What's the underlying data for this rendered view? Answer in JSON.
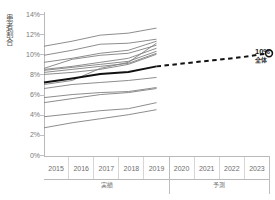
{
  "title": {
    "text": "",
    "clipped": true
  },
  "axes": {
    "y_label": "患者割合",
    "y_ticks": [
      "14%",
      "12%",
      "10%",
      "8%",
      "6%",
      "4%",
      "2%",
      "0%"
    ],
    "x_ticks": [
      "2015",
      "2016",
      "2017",
      "2018",
      "2019",
      "2020",
      "2021",
      "2022",
      "2023"
    ],
    "group_labels": [
      {
        "label": "実績",
        "span": [
          "2015",
          "2019"
        ]
      },
      {
        "label": "予測",
        "span": [
          "2020",
          "2023"
        ]
      }
    ]
  },
  "annotation": {
    "value": "10%",
    "sublabel": "全体"
  },
  "colors": {
    "background": "#ffffff",
    "axis": "#b9b9b9",
    "tick_text": "#7a7a7a",
    "series_light": "#808080",
    "series_total": "#111111",
    "marker_fill": "#ffffff",
    "marker_stroke": "#111111"
  },
  "chart_data": {
    "type": "line",
    "title": "",
    "xlabel": "",
    "ylabel": "患者割合",
    "x": [
      2015,
      2016,
      2017,
      2018,
      2019,
      2020,
      2021,
      2022,
      2023
    ],
    "ylim": [
      0,
      14
    ],
    "yticks": [
      0,
      2,
      4,
      6,
      8,
      10,
      12,
      14
    ],
    "grid": false,
    "legend": "none",
    "actual_range": [
      2015,
      2019
    ],
    "forecast_range": [
      2019,
      2023
    ],
    "series": [
      {
        "name": "全体",
        "emphasis": "total",
        "style": "solid-bold",
        "values": [
          7.2,
          7.6,
          8.05,
          8.25,
          8.8,
          null,
          null,
          null,
          null
        ]
      },
      {
        "name": "全体 (予測)",
        "emphasis": "total",
        "style": "dashed",
        "values": [
          null,
          null,
          null,
          null,
          8.8,
          9.1,
          9.4,
          9.7,
          10.1
        ]
      },
      {
        "name": "群1",
        "style": "thin",
        "values": [
          10.8,
          11.3,
          11.9,
          12.1,
          12.6,
          null,
          null,
          null,
          null
        ]
      },
      {
        "name": "群2",
        "style": "thin",
        "values": [
          9.9,
          10.4,
          11.0,
          11.1,
          11.5,
          null,
          null,
          null,
          null
        ]
      },
      {
        "name": "群3",
        "style": "thin",
        "values": [
          9.2,
          9.6,
          10.1,
          10.4,
          11.3,
          null,
          null,
          null,
          null
        ]
      },
      {
        "name": "群4",
        "style": "thin",
        "values": [
          8.6,
          9.5,
          9.9,
          10.1,
          10.9,
          null,
          null,
          null,
          null
        ]
      },
      {
        "name": "群5",
        "style": "thin",
        "values": [
          8.5,
          8.8,
          9.2,
          9.6,
          10.6,
          null,
          null,
          null,
          null
        ]
      },
      {
        "name": "群6",
        "style": "thin",
        "values": [
          8.4,
          8.7,
          9.0,
          9.3,
          10.3,
          null,
          null,
          null,
          null
        ]
      },
      {
        "name": "群7",
        "style": "thin",
        "values": [
          8.2,
          8.5,
          8.8,
          9.1,
          10.1,
          null,
          null,
          null,
          null
        ]
      },
      {
        "name": "群8",
        "style": "thin",
        "values": [
          8.0,
          8.2,
          8.5,
          9.0,
          10.0,
          null,
          null,
          null,
          null
        ]
      },
      {
        "name": "群9",
        "style": "thin",
        "values": [
          7.0,
          7.4,
          8.6,
          9.2,
          11.1,
          null,
          null,
          null,
          null
        ]
      },
      {
        "name": "群10",
        "style": "thin",
        "values": [
          6.6,
          7.0,
          7.2,
          7.4,
          7.7,
          null,
          null,
          null,
          null
        ]
      },
      {
        "name": "群11",
        "style": "thin",
        "values": [
          5.7,
          6.0,
          6.2,
          6.3,
          6.7,
          null,
          null,
          null,
          null
        ]
      },
      {
        "name": "群12",
        "style": "thin",
        "values": [
          5.2,
          5.6,
          6.0,
          6.2,
          6.6,
          null,
          null,
          null,
          null
        ]
      },
      {
        "name": "群13",
        "style": "thin",
        "values": [
          3.8,
          4.1,
          4.4,
          4.6,
          5.2,
          null,
          null,
          null,
          null
        ]
      },
      {
        "name": "群14",
        "style": "thin",
        "values": [
          2.7,
          3.2,
          3.6,
          4.0,
          4.5,
          null,
          null,
          null,
          null
        ]
      }
    ],
    "endpoint_marker": {
      "x": 2023,
      "y": 10.1,
      "shape": "open-circle"
    }
  }
}
